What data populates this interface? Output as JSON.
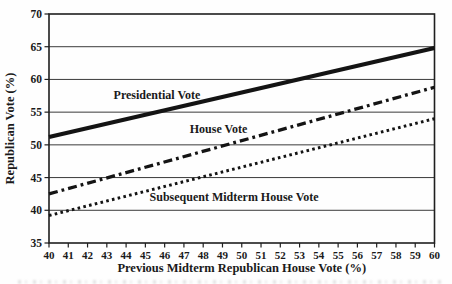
{
  "figure": {
    "background": "#fefefe"
  },
  "colors": {
    "line": "#141414",
    "grid": "#3a3a3a",
    "border": "#1f1f1f",
    "text": "#1a1a1a"
  },
  "chart_data": {
    "type": "line",
    "title": "",
    "xlabel": "Previous Midterm Republican House Vote (%)",
    "ylabel": "Republican Vote (%)",
    "xlim": [
      40,
      60
    ],
    "ylim": [
      35,
      70
    ],
    "x_ticks": [
      40,
      41,
      42,
      43,
      44,
      45,
      46,
      47,
      48,
      49,
      50,
      51,
      52,
      53,
      54,
      55,
      56,
      57,
      58,
      59,
      60
    ],
    "y_ticks": [
      35,
      40,
      45,
      50,
      55,
      60,
      65,
      70
    ],
    "grid": "horizontal-only",
    "legend_position": "inline-labels",
    "series": [
      {
        "name": "Presidential Vote",
        "style": "solid",
        "stroke_width": 4.2,
        "x": [
          40,
          60
        ],
        "values": [
          51.2,
          64.8
        ],
        "label": {
          "x": 45.6,
          "y": 57.6
        }
      },
      {
        "name": "House Vote",
        "style": "dash-dot",
        "stroke_width": 3.3,
        "x": [
          40,
          60
        ],
        "values": [
          42.5,
          58.8
        ],
        "label": {
          "x": 48.8,
          "y": 52.4
        }
      },
      {
        "name": "Subsequent Midterm House Vote",
        "style": "dotted",
        "stroke_width": 3.0,
        "x": [
          40,
          60
        ],
        "values": [
          39.2,
          54.0
        ],
        "label": {
          "x": 49.6,
          "y": 42.0
        }
      }
    ]
  }
}
